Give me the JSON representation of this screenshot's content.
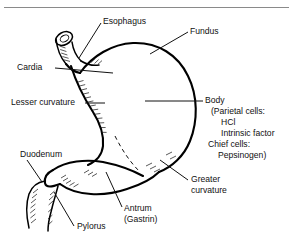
{
  "figure": {
    "top_rule": true,
    "background_color": "#ffffff",
    "line_color": "#000000",
    "text_color": "#111111"
  },
  "labels": {
    "esophagus": "Esophagus",
    "fundus": "Fundus",
    "cardia": "Cardia",
    "lesser_curvature": "Lesser curvature",
    "duodenum": "Duodenum",
    "pylorus": "Pylorus",
    "antrum_line1": "Antrum",
    "antrum_line2": "(Gastrin)",
    "greater_curvature_line1": "Greater",
    "greater_curvature_line2": "curvature",
    "body_line1": "Body",
    "body_line2": "(Parietal cells:",
    "body_line3": "HCl",
    "body_line4": "Intrinsic factor",
    "body_line5": "Chief cells:",
    "body_line6": "Pepsinogen)"
  },
  "parts": [
    "esophagus",
    "cardia",
    "fundus",
    "body",
    "lesser curvature",
    "greater curvature",
    "antrum",
    "pylorus",
    "duodenum"
  ]
}
